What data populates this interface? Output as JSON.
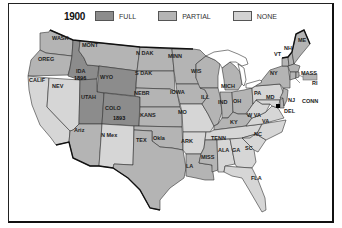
{
  "legend": {
    "year": "1900",
    "items": [
      {
        "label": "FULL",
        "color": "#8c8c8c"
      },
      {
        "label": "PARTIAL",
        "color": "#b4b4b4"
      },
      {
        "label": "NONE",
        "color": "#d2d2d2"
      }
    ]
  },
  "colors": {
    "full": "#8c8c8c",
    "partial": "#b4b4b4",
    "none": "#d6d6d6",
    "border": "#333333",
    "outline": "#111111"
  },
  "states": {
    "wash": {
      "label": "WASH",
      "status": "partial"
    },
    "oreg": {
      "label": "OREG",
      "status": "partial"
    },
    "calif": {
      "label": "CALIF",
      "status": "none"
    },
    "nev": {
      "label": "NEV",
      "status": "none"
    },
    "ida": {
      "label": "IDA",
      "status": "full",
      "year": "1896"
    },
    "mont": {
      "label": "MONT",
      "status": "partial"
    },
    "wyo": {
      "label": "WYO",
      "status": "full",
      "year": ""
    },
    "utah": {
      "label": "UTAH",
      "status": "full"
    },
    "colo": {
      "label": "COLO",
      "status": "full",
      "year": "1893"
    },
    "ariz": {
      "label": "Ariz",
      "status": "partial"
    },
    "nmex": {
      "label": "N Mex",
      "status": "none"
    },
    "ndak": {
      "label": "N DAK",
      "status": "partial"
    },
    "sdak": {
      "label": "S DAK",
      "status": "partial"
    },
    "nebr": {
      "label": "NEBR",
      "status": "partial"
    },
    "kans": {
      "label": "KANS",
      "status": "partial"
    },
    "okla": {
      "label": "Okla",
      "status": "partial"
    },
    "tex": {
      "label": "TEX",
      "status": "partial"
    },
    "minn": {
      "label": "MINN",
      "status": "partial"
    },
    "iowa": {
      "label": "IOWA",
      "status": "partial"
    },
    "mo": {
      "label": "MO",
      "status": "none"
    },
    "ark": {
      "label": "ARK",
      "status": "none"
    },
    "la": {
      "label": "LA",
      "status": "partial"
    },
    "wis": {
      "label": "WIS",
      "status": "partial"
    },
    "ill": {
      "label": "ILL",
      "status": "partial"
    },
    "mich": {
      "label": "MICH",
      "status": "partial"
    },
    "ind": {
      "label": "IND",
      "status": "partial"
    },
    "oh": {
      "label": "OH",
      "status": "partial"
    },
    "ky": {
      "label": "KY",
      "status": "partial"
    },
    "tenn": {
      "label": "TENN",
      "status": "none"
    },
    "miss": {
      "label": "MISS",
      "status": "partial"
    },
    "ala": {
      "label": "ALA",
      "status": "none"
    },
    "ga": {
      "label": "GA",
      "status": "none"
    },
    "fla": {
      "label": "FLA",
      "status": "none"
    },
    "sc": {
      "label": "SC",
      "status": "none"
    },
    "nc": {
      "label": "NC",
      "status": "none"
    },
    "va": {
      "label": "VA",
      "status": "none"
    },
    "wva": {
      "label": "W VA",
      "status": "none"
    },
    "pa": {
      "label": "PA",
      "status": "none"
    },
    "md": {
      "label": "MD",
      "status": "none"
    },
    "del": {
      "label": "DEL",
      "status": "partial"
    },
    "nj": {
      "label": "NJ",
      "status": "partial"
    },
    "ny": {
      "label": "NY",
      "status": "partial"
    },
    "vt": {
      "label": "VT",
      "status": "partial"
    },
    "nh": {
      "label": "NH",
      "status": "partial"
    },
    "me": {
      "label": "ME",
      "status": "partial"
    },
    "mass": {
      "label": "MASS",
      "status": "partial"
    },
    "ri": {
      "label": "RI",
      "status": "partial"
    },
    "conn": {
      "label": "CONN",
      "status": "partial"
    }
  }
}
